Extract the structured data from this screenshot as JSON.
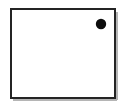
{
  "canvas": {
    "width": 126,
    "height": 106,
    "background_color": "#ffffff",
    "title": "Rectangle with single dot"
  },
  "diagram": {
    "type": "shape-diagram",
    "shapes": [
      {
        "id": "outline-rectangle",
        "name": "rectangle-outline",
        "kind": "rect",
        "x": 11,
        "y": 9,
        "width": 104,
        "height": 89,
        "fill": "#ffffff",
        "stroke": "#242424",
        "stroke_width": 2
      },
      {
        "id": "shadow-right",
        "name": "rectangle-shadow-right",
        "kind": "line",
        "x1": 117,
        "y1": 12,
        "x2": 117,
        "y2": 100,
        "stroke": "#b5b5b5",
        "stroke_width": 2
      },
      {
        "id": "shadow-bottom",
        "name": "rectangle-shadow-bottom",
        "kind": "line",
        "x1": 13,
        "y1": 100,
        "x2": 117,
        "y2": 100,
        "stroke": "#b5b5b5",
        "stroke_width": 2
      },
      {
        "id": "dot-1",
        "name": "black-dot",
        "kind": "circle",
        "cx": 101,
        "cy": 24,
        "r": 5.2,
        "fill": "#0d0d0d",
        "stroke": "none"
      }
    ]
  },
  "legend": {
    "dot_count": 1,
    "dot_color": "#0d0d0d",
    "outline_color": "#242424"
  }
}
